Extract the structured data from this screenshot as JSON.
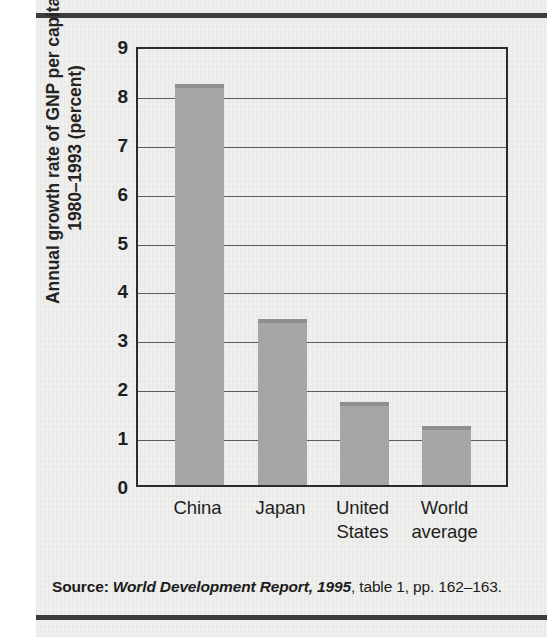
{
  "figure": {
    "y_axis_title_line1": "Annual growth rate of GNP per capita,",
    "y_axis_title_line2": "1980–1993 (percent)"
  },
  "source": {
    "label": "Source:",
    "title": "World Development Report, 1995",
    "rest": ", table 1, pp. 162–163."
  },
  "colors": {
    "bar_fill": "#a6a6a6",
    "bar_top_edge": "#8f8f8f",
    "axis": "#2b2b2b",
    "gridline": "#5c5c5c",
    "page_panel": "#efefed",
    "rule": "#3c3c3c",
    "text": "#1e1e1e"
  },
  "chart_data": {
    "type": "bar",
    "title": "",
    "xlabel": "",
    "ylabel": "Annual growth rate of GNP per capita, 1980–1993 (percent)",
    "categories": [
      "China",
      "Japan",
      "United States",
      "World average"
    ],
    "category_lines": [
      [
        "China"
      ],
      [
        "Japan"
      ],
      [
        "United",
        "States"
      ],
      [
        "World",
        "average"
      ]
    ],
    "values": [
      8.2,
      3.4,
      1.7,
      1.2
    ],
    "ylim": [
      0,
      9
    ],
    "ytick_labels": [
      "0",
      "1",
      "2",
      "3",
      "4",
      "5",
      "6",
      "7",
      "8",
      "9"
    ],
    "ytick_values": [
      0,
      1,
      2,
      3,
      4,
      5,
      6,
      7,
      8,
      9
    ],
    "grid": true,
    "grid_axis": "y",
    "legend": false,
    "legend_position": "none",
    "series": [
      {
        "name": "Annual growth rate of GNP per capita, 1980–1993 (percent)",
        "values": [
          8.2,
          3.4,
          1.7,
          1.2
        ]
      }
    ]
  }
}
